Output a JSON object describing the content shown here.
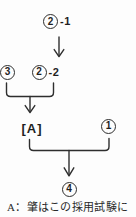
{
  "colors": {
    "background": "#fdfdfd",
    "line": "#2e2e2e",
    "text": "#1f1f1f"
  },
  "diagram": {
    "top_node": {
      "number": "2",
      "suffix": "-1"
    },
    "left_node": {
      "number": "3"
    },
    "mid_node": {
      "number": "2",
      "suffix": "-2"
    },
    "result_a": "[A]",
    "right_node": {
      "number": "1"
    },
    "bottom_node": {
      "number": "4"
    }
  },
  "caption": "A：肇はこの採用試験に"
}
